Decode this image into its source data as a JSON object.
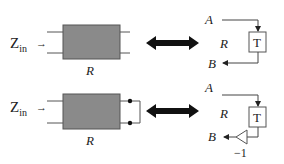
{
  "top": {
    "zin_label": "Z",
    "zin_sub": "in",
    "arrow": "→",
    "box_label": "R",
    "node_a": "A",
    "node_b": "B",
    "mid_label": "R",
    "t_label": "T"
  },
  "bottom": {
    "zin_label": "Z",
    "zin_sub": "in",
    "arrow": "→",
    "box_label": "R",
    "node_a": "A",
    "node_b": "B",
    "mid_label": "R",
    "t_label": "T",
    "gain_label": "−1"
  },
  "colors": {
    "box_fill": "#8a8a8a",
    "box_stroke": "#555555",
    "line": "#444444",
    "arrow": "#111111"
  }
}
